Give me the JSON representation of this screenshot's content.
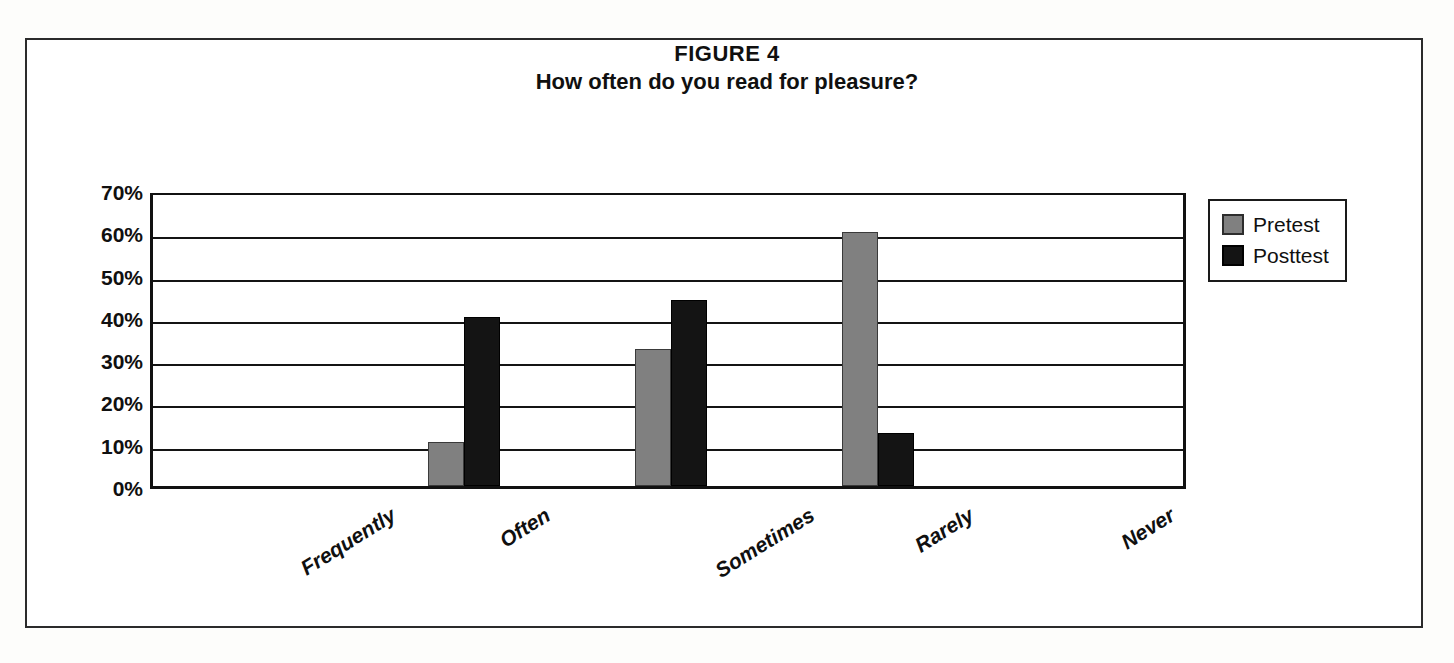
{
  "figure": {
    "title_line1": "FIGURE 4",
    "title_line2": "How often do you read for pleasure?"
  },
  "legend": {
    "position": "right",
    "entries": [
      {
        "label": "Pretest",
        "color": "#808080",
        "swatch": "pretest-swatch"
      },
      {
        "label": "Posttest",
        "color": "#141414",
        "swatch": "posttest-swatch"
      }
    ]
  },
  "axes": {
    "y_ticks": [
      "70%",
      "60%",
      "50%",
      "40%",
      "30%",
      "20%",
      "10%",
      "0%"
    ],
    "x_ticks": [
      "Frequently",
      "Often",
      "Sometimes",
      "Rarely",
      "Never"
    ]
  },
  "chart_data": {
    "type": "bar",
    "xlabel": "",
    "ylabel": "",
    "ylim": [
      0,
      70
    ],
    "ytick_values": [
      0,
      10,
      20,
      30,
      40,
      50,
      60,
      70
    ],
    "ytick_labels": [
      "0%",
      "10%",
      "20%",
      "30%",
      "40%",
      "50%",
      "60%",
      "70%"
    ],
    "grid": true,
    "grid_axis": "y",
    "legend_position": "right",
    "categories": [
      "Frequently",
      "Often",
      "Sometimes",
      "Rarely",
      "Never"
    ],
    "series": [
      {
        "name": "Pretest",
        "color": "#808080",
        "values": [
          0,
          10.5,
          32.5,
          60,
          0
        ]
      },
      {
        "name": "Posttest",
        "color": "#141414",
        "values": [
          0,
          40,
          44,
          12.5,
          0
        ]
      }
    ],
    "units": "percent"
  }
}
